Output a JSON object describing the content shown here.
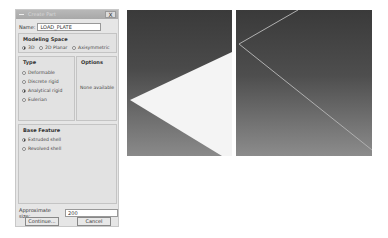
{
  "dialog": {
    "title": "Create Part",
    "close_label": "X",
    "name_label": "Name:",
    "name_value": "LOAD_PLATE",
    "modeling_space": {
      "title": "Modeling Space",
      "options": [
        "3D",
        "2D Planar",
        "Axisymmetric"
      ],
      "selected": "3D"
    },
    "type": {
      "title": "Type",
      "options": [
        "Deformable",
        "Discrete rigid",
        "Analytical rigid",
        "Eulerian"
      ],
      "selected": "Analytical rigid"
    },
    "options": {
      "title": "Options",
      "text": "None available"
    },
    "base_feature": {
      "title": "Base Feature",
      "options": [
        "Extruded shell",
        "Revolved shell"
      ],
      "selected": "Extruded shell"
    },
    "approx_size_label": "Approximate size:",
    "approx_size_value": "200",
    "continue_label": "Continue...",
    "cancel_label": "Cancel"
  },
  "viewports": {
    "left": {
      "content": "shaded analytical rigid plate"
    },
    "right": {
      "content": "wireframe analytical rigid plate"
    }
  }
}
